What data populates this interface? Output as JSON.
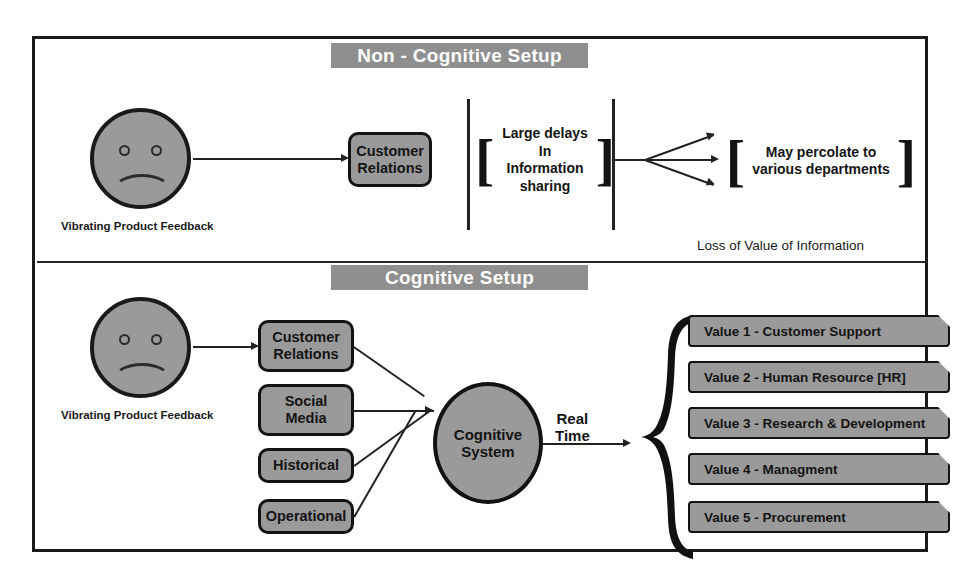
{
  "diagram": {
    "title_top": "Non - Cognitive Setup",
    "title_bottom": "Cognitive Setup",
    "colors": {
      "node_fill": "#9a9a9a",
      "header_fill": "#8f8f8f",
      "stroke": "#131313",
      "background": "#ffffff"
    }
  },
  "top_section": {
    "header": "Non - Cognitive Setup",
    "face_caption": "Vibrating Product Feedback",
    "node": "Customer\nRelations",
    "note_delay": "Large delays\nIn Information\nsharing",
    "note_percolate": "May percolate to\nvarious departments",
    "footer_note": "Loss of Value of Information",
    "bracket_open": "[",
    "bracket_close": "]"
  },
  "bottom_section": {
    "header": "Cognitive Setup",
    "face_caption": "Vibrating Product Feedback",
    "inputs": [
      {
        "label": "Customer\nRelations"
      },
      {
        "label": "Social\nMedia"
      },
      {
        "label": "Historical"
      },
      {
        "label": "Operational"
      }
    ],
    "engine": {
      "line1": "Cognitive",
      "line2": "System"
    },
    "flow_label": {
      "line1": "Real",
      "line2": "Time"
    },
    "outputs": [
      {
        "label": "Value 1 - Customer Support"
      },
      {
        "label": "Value 2 - Human Resource [HR]"
      },
      {
        "label": "Value 3 - Research & Development"
      },
      {
        "label": "Value 4 - Managment"
      },
      {
        "label": "Value 5 - Procurement"
      }
    ]
  }
}
